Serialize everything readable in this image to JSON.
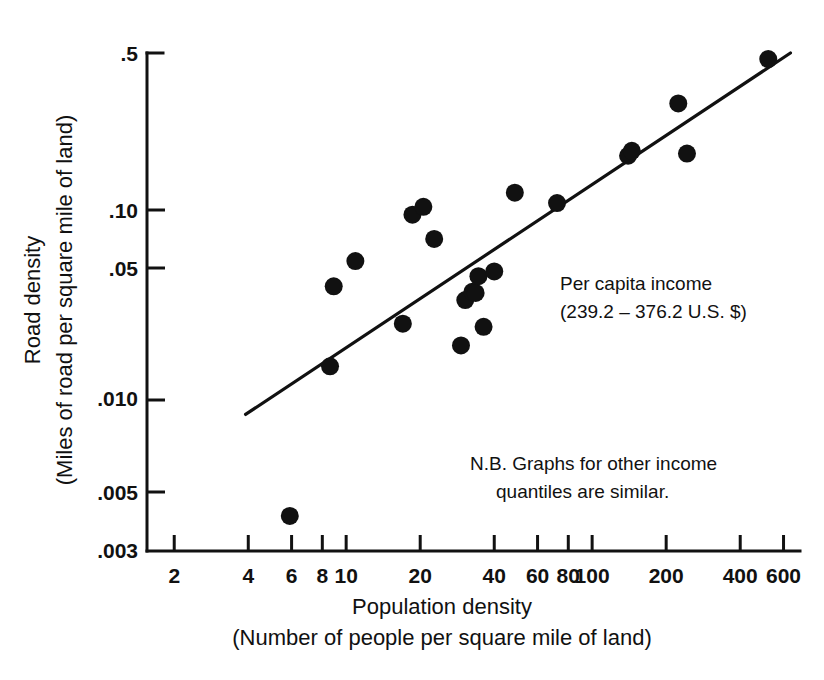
{
  "chart_data": {
    "type": "scatter",
    "title": "",
    "xlabel": "Population density",
    "xlabel_sub": "(Number of people per square mile of land)",
    "ylabel": "Road density",
    "ylabel_sub": "(Miles of road per square mile of land)",
    "xscale": "log",
    "yscale": "log",
    "xlim": [
      1.55,
      700
    ],
    "ylim": [
      0.003,
      0.5
    ],
    "grid": false,
    "legend": "none",
    "xticks": [
      2,
      4,
      6,
      8,
      10,
      20,
      40,
      60,
      80,
      100,
      200,
      400,
      600
    ],
    "xticklabels": [
      "2",
      "4",
      "6",
      "8",
      "10",
      "20",
      "40",
      "60",
      "80",
      "100",
      "200",
      "400",
      "600"
    ],
    "yticks": [
      0.003,
      0.005,
      0.01,
      0.05,
      0.1,
      0.5
    ],
    "yticklabels": [
      ".003",
      ".005",
      ".010",
      ".05",
      ".10",
      ".5"
    ],
    "series": [
      {
        "name": "countries",
        "marker": "filled-circle",
        "color": "#111111",
        "points": [
          {
            "x": 5.9,
            "y": 0.0043
          },
          {
            "x": 8.6,
            "y": 0.02
          },
          {
            "x": 8.9,
            "y": 0.0455
          },
          {
            "x": 10.9,
            "y": 0.059
          },
          {
            "x": 17.0,
            "y": 0.031
          },
          {
            "x": 18.6,
            "y": 0.095
          },
          {
            "x": 20.6,
            "y": 0.103
          },
          {
            "x": 22.8,
            "y": 0.074
          },
          {
            "x": 29.3,
            "y": 0.0248
          },
          {
            "x": 30.5,
            "y": 0.0395
          },
          {
            "x": 32.6,
            "y": 0.043
          },
          {
            "x": 33.6,
            "y": 0.0425
          },
          {
            "x": 34.5,
            "y": 0.0505
          },
          {
            "x": 36.2,
            "y": 0.03
          },
          {
            "x": 40.0,
            "y": 0.053
          },
          {
            "x": 48.5,
            "y": 0.119
          },
          {
            "x": 72.0,
            "y": 0.107
          },
          {
            "x": 140.0,
            "y": 0.174
          },
          {
            "x": 145.0,
            "y": 0.183
          },
          {
            "x": 224.0,
            "y": 0.298
          },
          {
            "x": 243.0,
            "y": 0.178
          },
          {
            "x": 520.0,
            "y": 0.47
          }
        ]
      }
    ],
    "fit_line": {
      "name": "regression-line",
      "x_start": 3.9,
      "y_start": 0.0122,
      "x_end": 640.0,
      "y_end": 0.5
    },
    "annotations": [
      {
        "name": "per-capita-income-note",
        "lines": [
          "Per capita income",
          "(239.2 – 376.2 U.S. $)"
        ]
      },
      {
        "name": "nb-note",
        "lines": [
          "N.B. Graphs for other income",
          "quantiles are similar."
        ]
      }
    ]
  }
}
